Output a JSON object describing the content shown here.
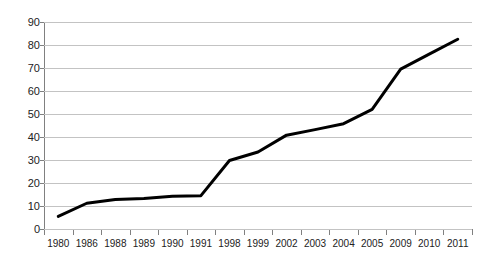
{
  "figure": {
    "cropped_title_remnant": ""
  },
  "chart_data": {
    "type": "line",
    "title": "",
    "subtitle": "",
    "xlabel": "",
    "ylabel": "",
    "categories": [
      "1980",
      "1986",
      "1988",
      "1989",
      "1990",
      "1991",
      "1998",
      "1999",
      "2002",
      "2003",
      "2004",
      "2005",
      "2009",
      "2010",
      "2011"
    ],
    "values": [
      5.5,
      11.2,
      12.8,
      13.3,
      14.2,
      14.5,
      29.8,
      33.5,
      40.8,
      43.2,
      45.8,
      52.0,
      69.5,
      76.0,
      82.5
    ],
    "series": [
      {
        "name": "",
        "values": [
          5.5,
          11.2,
          12.8,
          13.3,
          14.2,
          14.5,
          29.8,
          33.5,
          40.8,
          43.2,
          45.8,
          52.0,
          69.5,
          76.0,
          82.5
        ]
      }
    ],
    "ylim": [
      0,
      90
    ],
    "yticks": [
      0,
      10,
      20,
      30,
      40,
      50,
      60,
      70,
      80,
      90
    ],
    "ytick_labels": [
      "0",
      "10",
      "20",
      "30",
      "40",
      "50",
      "60",
      "70",
      "80",
      "90"
    ],
    "grid": true,
    "grid_axis": "y",
    "legend": false,
    "legend_position": "none",
    "line_color": "#000000",
    "line_width": 3,
    "markers": false,
    "gridline_color": "#c3c3c3",
    "axis_color": "#808080",
    "background_color": "#ffffff"
  }
}
